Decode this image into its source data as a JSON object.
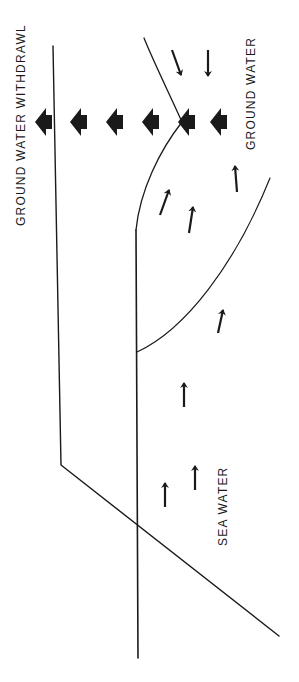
{
  "labels": {
    "withdrawal": "GROUND WATER WITHDRAWL",
    "ground_water": "GROUND WATER",
    "sea_water": "SEA WATER"
  },
  "colors": {
    "ink": "#1a1a1a",
    "background": "#ffffff"
  },
  "orientation": "rotated 90 degrees counter-clockwise",
  "elements": {
    "block_arrows_count": 6,
    "ground_water_flow_arrows": 6,
    "sea_water_flow_arrows": 4
  }
}
